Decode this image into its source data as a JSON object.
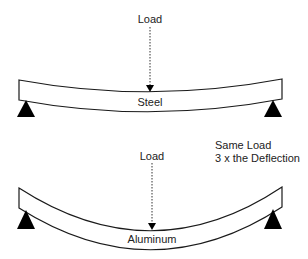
{
  "diagram": {
    "top": {
      "load_label": "Load",
      "beam_label": "Steel"
    },
    "bottom": {
      "load_label": "Load",
      "beam_label": "Aluminum"
    },
    "annotation": {
      "line1": "Same Load",
      "line2": "3 x the Deflection"
    },
    "colors": {
      "stroke": "#1a1a1a",
      "support_fill": "#000000",
      "text": "#222222"
    }
  }
}
